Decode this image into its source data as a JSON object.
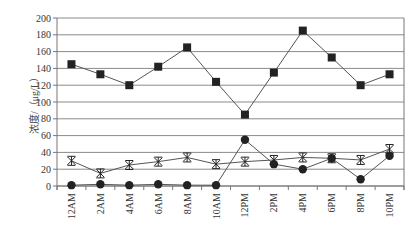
{
  "chart_data": {
    "type": "line",
    "title": "",
    "xlabel": "",
    "ylabel": "浓度/（μg/L）",
    "ylim": [
      0,
      200
    ],
    "yticks": [
      0,
      20,
      40,
      60,
      80,
      100,
      120,
      140,
      160,
      180,
      200
    ],
    "grid": true,
    "legend": null,
    "categories": [
      "12AM",
      "2AM",
      "4AM",
      "6AM",
      "8AM",
      "10AM",
      "12PM",
      "2PM",
      "4PM",
      "6PM",
      "8PM",
      "10PM"
    ],
    "series": [
      {
        "name": "square-series",
        "marker": "square",
        "values": [
          145,
          133,
          120,
          142,
          165,
          124,
          85,
          135,
          185,
          153,
          120,
          133
        ]
      },
      {
        "name": "star-series",
        "marker": "star",
        "values": [
          30,
          15,
          25,
          29,
          34,
          26,
          29,
          31,
          34,
          33,
          31,
          44
        ]
      },
      {
        "name": "circle-series",
        "marker": "circle",
        "values": [
          1,
          2,
          1,
          2,
          1,
          1,
          55,
          26,
          20,
          33,
          8,
          36
        ]
      }
    ],
    "colors": {
      "line": "#555555",
      "marker": "#222222",
      "grid": "#8a8a8a",
      "axis": "#777777"
    }
  }
}
